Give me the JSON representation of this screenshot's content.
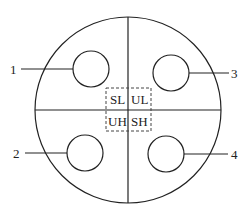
{
  "diagram": {
    "type": "quadrant-circle-with-pins",
    "outer_circle": {
      "cx": 128,
      "cy": 110,
      "r": 93
    },
    "dividers": {
      "vertical_x": 128,
      "horizontal_y": 110
    },
    "center_box": {
      "x": 106,
      "y": 88,
      "w": 45,
      "h": 43,
      "labels": {
        "top_left": "SL",
        "top_right": "UL",
        "bottom_left": "UH",
        "bottom_right": "SH"
      }
    },
    "pins": [
      {
        "id": "1",
        "label": "1",
        "cx": 91,
        "cy": 69,
        "r": 18,
        "side": "left"
      },
      {
        "id": "2",
        "label": "2",
        "cx": 85,
        "cy": 153,
        "r": 18,
        "side": "left"
      },
      {
        "id": "3",
        "label": "3",
        "cx": 171,
        "cy": 73,
        "r": 18,
        "side": "right"
      },
      {
        "id": "4",
        "label": "4",
        "cx": 166,
        "cy": 154,
        "r": 18,
        "side": "right"
      }
    ],
    "colors": {
      "line": "#222222",
      "background": "#ffffff"
    }
  }
}
